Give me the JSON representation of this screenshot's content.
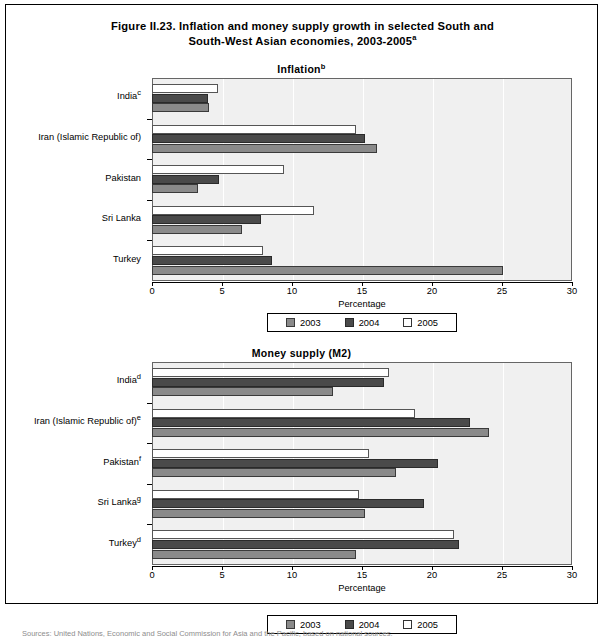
{
  "figure": {
    "title_line1": "Figure II.23. Inflation and money supply growth in selected South and",
    "title_line2": "South-West Asian economies, 2003-2005",
    "title_superscript": "a"
  },
  "legend": {
    "items": [
      {
        "label": "2003",
        "color": "#8a8a8a"
      },
      {
        "label": "2004",
        "color": "#4a4a4a"
      },
      {
        "label": "2005",
        "color": "#ffffff"
      }
    ]
  },
  "axis": {
    "xlabel": "Percentage",
    "ticks": [
      "0",
      "5",
      "10",
      "15",
      "20",
      "25",
      "30"
    ]
  },
  "source": {
    "text": "Sources:  United Nations, Economic and Social Commission for Asia and the Pacific, based on national sources."
  },
  "chart_data": [
    {
      "type": "bar",
      "orientation": "horizontal",
      "title": "Inflation",
      "title_superscript": "b",
      "xlabel": "Percentage",
      "ylabel": "",
      "xlim": [
        0,
        30
      ],
      "xticks": [
        0,
        5,
        10,
        15,
        20,
        25,
        30
      ],
      "grid": true,
      "legend_position": "bottom",
      "categories": [
        {
          "label": "India",
          "superscript": "c"
        },
        {
          "label": "Iran (Islamic Republic of)",
          "superscript": ""
        },
        {
          "label": "Pakistan",
          "superscript": ""
        },
        {
          "label": "Sri Lanka",
          "superscript": ""
        },
        {
          "label": "Turkey",
          "superscript": ""
        }
      ],
      "series": [
        {
          "name": "2003",
          "values": [
            4.1,
            16.1,
            3.3,
            6.4,
            25.1
          ]
        },
        {
          "name": "2004",
          "values": [
            4.0,
            15.2,
            4.8,
            7.8,
            8.6
          ]
        },
        {
          "name": "2005",
          "values": [
            4.7,
            14.6,
            9.4,
            11.6,
            7.9
          ]
        }
      ]
    },
    {
      "type": "bar",
      "orientation": "horizontal",
      "title": "Money supply (M2)",
      "title_superscript": "",
      "xlabel": "Percentage",
      "ylabel": "",
      "xlim": [
        0,
        30
      ],
      "xticks": [
        0,
        5,
        10,
        15,
        20,
        25,
        30
      ],
      "grid": true,
      "legend_position": "bottom",
      "categories": [
        {
          "label": "India",
          "superscript": "d"
        },
        {
          "label": "Iran (Islamic Republic of)",
          "superscript": "e"
        },
        {
          "label": "Pakistan",
          "superscript": "f"
        },
        {
          "label": "Sri Lanka",
          "superscript": "g"
        },
        {
          "label": "Turkey",
          "superscript": "d"
        }
      ],
      "series": [
        {
          "name": "2003",
          "values": [
            12.9,
            24.1,
            17.4,
            15.2,
            14.6
          ]
        },
        {
          "name": "2004",
          "values": [
            16.6,
            22.7,
            20.4,
            19.4,
            21.9
          ]
        },
        {
          "name": "2005",
          "values": [
            16.9,
            18.8,
            15.5,
            14.8,
            21.6
          ]
        }
      ]
    }
  ]
}
